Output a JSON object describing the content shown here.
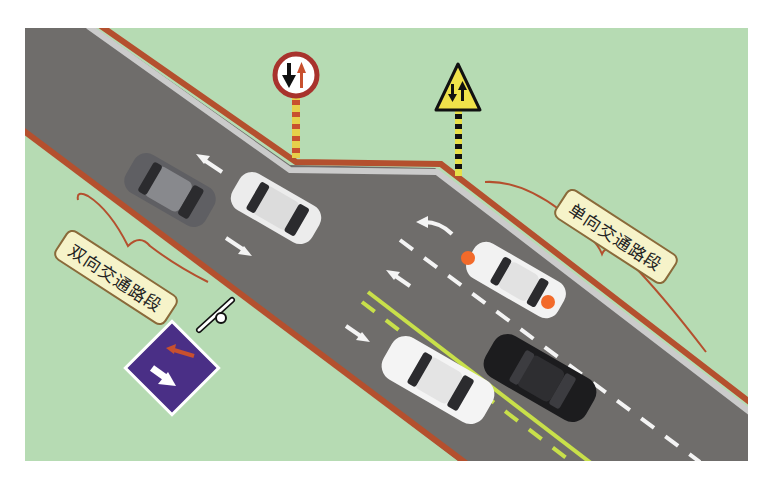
{
  "labels": {
    "one_way_section": "单向交通路段",
    "two_way_section": "双向交通路段"
  },
  "signs": [
    {
      "name": "yield-to-oncoming-sign",
      "shape": "circle",
      "description": "Round sign with red ring, black down arrow and red up arrow"
    },
    {
      "name": "two-way-traffic-warning-sign",
      "shape": "triangle",
      "description": "Yellow triangle warning sign with down and up arrows"
    },
    {
      "name": "right-of-way-over-oncoming-sign",
      "shape": "square",
      "description": "Blue/purple square sign with large white down arrow and small red up arrow"
    }
  ],
  "colors": {
    "grass": "#b6dbb3",
    "asphalt": "#6f6d6b",
    "curb_red": "#b4502e",
    "curb_gray": "#c9c9c9",
    "yellow_line": "#c8e04a",
    "sign_purple": "#4a2f86",
    "warning_yellow": "#f0e24a",
    "label_bg": "#f6f3c9"
  },
  "vehicles": [
    {
      "name": "dark-gray-suv",
      "color": "#6a6a6e"
    },
    {
      "name": "white-suv",
      "color": "#ececec"
    },
    {
      "name": "white-sedan-hazard-lights",
      "color": "#f2f2f2"
    },
    {
      "name": "white-sedan",
      "color": "#f4f4f4"
    },
    {
      "name": "black-sedan",
      "color": "#1c1c1e"
    }
  ]
}
